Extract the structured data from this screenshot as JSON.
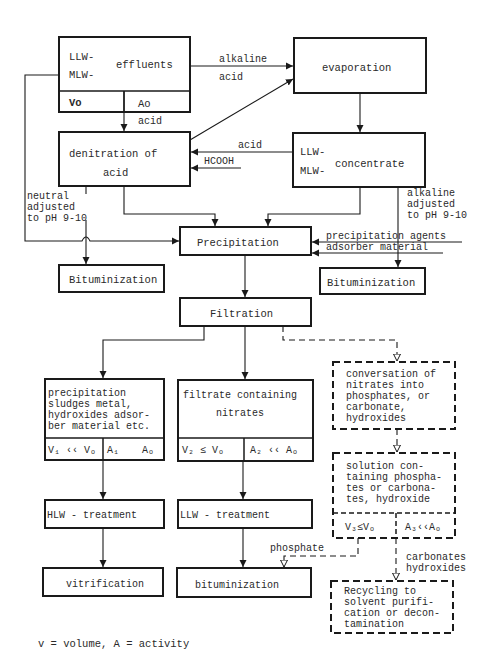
{
  "nodes": {
    "effluents": {
      "prefix1": "LLW-",
      "prefix2": "MLW-",
      "label": "effluents",
      "cell_left": "Vo",
      "cell_right": "Ao"
    },
    "evaporation": {
      "label": "evaporation"
    },
    "denitration": {
      "line1": "denitration of",
      "line2": "acid"
    },
    "concentrate": {
      "prefix1": "LLW-",
      "prefix2": "MLW-",
      "label": "concentrate"
    },
    "precipitation": {
      "label": "Precipitation"
    },
    "bituminization_left": {
      "label": "Bituminization"
    },
    "bituminization_right": {
      "label": "Bituminization"
    },
    "filtration": {
      "label": "Filtration"
    },
    "sludges": {
      "lines": [
        "precipitation",
        "sludges metal,",
        "hydroxides adsor-",
        "ber material etc."
      ],
      "cell_left": "V₁ ‹‹ Vₒ",
      "cell_right_a": "A₁",
      "cell_right_b": "Aₒ"
    },
    "filtrate": {
      "line1": "filtrate containing",
      "line2": "nitrates",
      "cell_left": "V₂ ≤ Vₒ",
      "cell_right": "A₂ ‹‹ Aₒ"
    },
    "conversion": {
      "lines": [
        "conversation of",
        "nitrates into",
        "phosphates, or",
        "carbonate,",
        "hydroxides"
      ]
    },
    "solution": {
      "lines": [
        "solution con-",
        "taining phospha-",
        "tes or carbona-",
        "tes, hydroxide"
      ],
      "cell_left": "V₃≤Vₒ",
      "cell_right": "A₃‹‹Aₒ"
    },
    "hlw_treatment": {
      "label": "HLW - treatment"
    },
    "llw_treatment": {
      "label": "LLW - treatment"
    },
    "vitrification": {
      "label": "vitrification"
    },
    "bituminization_bottom": {
      "label": "bituminization"
    },
    "recycling": {
      "lines": [
        "Recycling to",
        "solvent purifi-",
        "cation or decon-",
        "tamination"
      ]
    }
  },
  "edge_labels": {
    "alkaline": "alkaline",
    "acid_top": "acid",
    "acid_down": "acid",
    "acid_back": "acid",
    "hcooh": "HCOOH",
    "neutral": [
      "neutral",
      "adjusted",
      "to pH 9-10"
    ],
    "alkaline_right": [
      "alkaline",
      "adjusted",
      "to pH 9-10"
    ],
    "precip_agents": "precipitation agents",
    "adsorber": "adsorber material",
    "phosphate": "phosphate",
    "carbonates": [
      "carbonates",
      "hydroxides"
    ]
  },
  "legend": "v = volume, A = activity"
}
